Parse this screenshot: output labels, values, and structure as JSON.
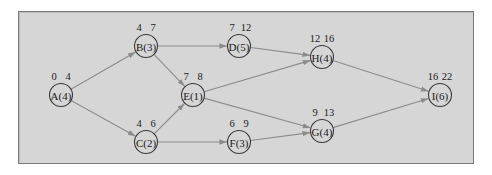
{
  "diagram": {
    "type": "activity-on-node network",
    "nodes": [
      {
        "id": "A",
        "label": "A(4)",
        "duration": 4,
        "es": "0",
        "ef": "4",
        "x": 61,
        "y": 95
      },
      {
        "id": "B",
        "label": "B(3)",
        "duration": 3,
        "es": "4",
        "ef": "7",
        "x": 146,
        "y": 46
      },
      {
        "id": "C",
        "label": "C(2)",
        "duration": 2,
        "es": "4",
        "ef": "6",
        "x": 146,
        "y": 142
      },
      {
        "id": "D",
        "label": "D(5)",
        "duration": 5,
        "es": "7",
        "ef": "12",
        "x": 239,
        "y": 46
      },
      {
        "id": "E",
        "label": "E(1)",
        "duration": 1,
        "es": "7",
        "ef": "8",
        "x": 193,
        "y": 95
      },
      {
        "id": "F",
        "label": "F(3)",
        "duration": 3,
        "es": "6",
        "ef": "9",
        "x": 239,
        "y": 142
      },
      {
        "id": "H",
        "label": "H(4)",
        "duration": 4,
        "es": "12",
        "ef": "16",
        "x": 322,
        "y": 57
      },
      {
        "id": "G",
        "label": "G(4)",
        "duration": 4,
        "es": "9",
        "ef": "13",
        "x": 322,
        "y": 131
      },
      {
        "id": "I",
        "label": "I(6)",
        "duration": 6,
        "es": "16",
        "ef": "22",
        "x": 440,
        "y": 95
      }
    ],
    "edges": [
      {
        "from": "A",
        "to": "B"
      },
      {
        "from": "A",
        "to": "C"
      },
      {
        "from": "B",
        "to": "D"
      },
      {
        "from": "B",
        "to": "E"
      },
      {
        "from": "C",
        "to": "E"
      },
      {
        "from": "C",
        "to": "F"
      },
      {
        "from": "D",
        "to": "H"
      },
      {
        "from": "E",
        "to": "H"
      },
      {
        "from": "E",
        "to": "G"
      },
      {
        "from": "F",
        "to": "G"
      },
      {
        "from": "H",
        "to": "I"
      },
      {
        "from": "G",
        "to": "I"
      }
    ],
    "colors": {
      "background": "#d6d6d6",
      "edge": "#8c8c8c",
      "node_stroke": "#3a3a3a",
      "text": "#1a1a1a"
    }
  }
}
